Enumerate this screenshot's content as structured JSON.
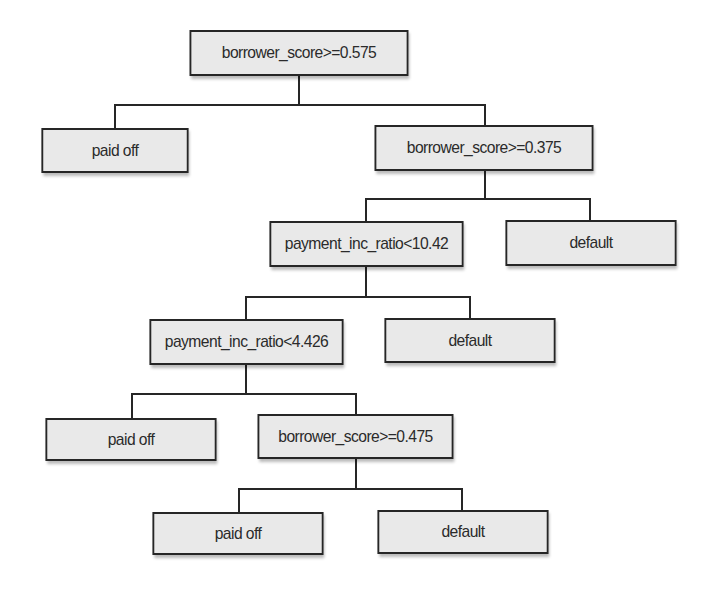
{
  "diagram": {
    "type": "decision-tree",
    "colors": {
      "node_fill": "#e9e9e9",
      "node_border": "#262626",
      "text": "#2b2b2b",
      "edge": "#262626",
      "background": "#ffffff"
    },
    "nodes": [
      {
        "id": "n1",
        "label": "borrower_score>=0.575",
        "kind": "split",
        "x": 180,
        "y": 30,
        "w": 238,
        "h": 46
      },
      {
        "id": "n2",
        "label": "paid off",
        "kind": "leaf",
        "x": 35,
        "y": 128,
        "w": 160,
        "h": 45
      },
      {
        "id": "n3",
        "label": "borrower_score>=0.375",
        "kind": "split",
        "x": 365,
        "y": 125,
        "w": 238,
        "h": 46
      },
      {
        "id": "n4",
        "label": "payment_inc_ratio<10.42",
        "kind": "split",
        "x": 261,
        "y": 221,
        "w": 211,
        "h": 46
      },
      {
        "id": "n5",
        "label": "default",
        "kind": "leaf",
        "x": 498,
        "y": 220,
        "w": 186,
        "h": 46
      },
      {
        "id": "n6",
        "label": "payment_inc_ratio<4.426",
        "kind": "split",
        "x": 141,
        "y": 319,
        "w": 211,
        "h": 46
      },
      {
        "id": "n7",
        "label": "default",
        "kind": "leaf",
        "x": 377,
        "y": 318,
        "w": 186,
        "h": 45
      },
      {
        "id": "n8",
        "label": "paid off",
        "kind": "leaf",
        "x": 38,
        "y": 418,
        "w": 186,
        "h": 43
      },
      {
        "id": "n9",
        "label": "borrower_score>=0.475",
        "kind": "split",
        "x": 249,
        "y": 414,
        "w": 213,
        "h": 45
      },
      {
        "id": "n10",
        "label": "paid off",
        "kind": "leaf",
        "x": 145,
        "y": 512,
        "w": 186,
        "h": 43
      },
      {
        "id": "n11",
        "label": "default",
        "kind": "leaf",
        "x": 370,
        "y": 510,
        "w": 186,
        "h": 44
      }
    ],
    "edges": [
      {
        "from": "n1",
        "to": "n2"
      },
      {
        "from": "n1",
        "to": "n3"
      },
      {
        "from": "n3",
        "to": "n4"
      },
      {
        "from": "n3",
        "to": "n5"
      },
      {
        "from": "n4",
        "to": "n6"
      },
      {
        "from": "n4",
        "to": "n7"
      },
      {
        "from": "n6",
        "to": "n8"
      },
      {
        "from": "n6",
        "to": "n9"
      },
      {
        "from": "n9",
        "to": "n10"
      },
      {
        "from": "n9",
        "to": "n11"
      }
    ],
    "connectors": [
      {
        "parent_x": 299,
        "parent_bottom": 76,
        "bar_y": 104,
        "left_x": 115,
        "right_x": 485,
        "left_top": 128,
        "right_top": 125
      },
      {
        "parent_x": 485,
        "parent_bottom": 171,
        "bar_y": 198,
        "left_x": 366,
        "right_x": 590,
        "left_top": 221,
        "right_top": 220
      },
      {
        "parent_x": 366,
        "parent_bottom": 267,
        "bar_y": 296,
        "left_x": 246,
        "right_x": 470,
        "left_top": 319,
        "right_top": 318
      },
      {
        "parent_x": 246,
        "parent_bottom": 365,
        "bar_y": 393,
        "left_x": 132,
        "right_x": 356,
        "left_top": 418,
        "right_top": 414
      },
      {
        "parent_x": 356,
        "parent_bottom": 459,
        "bar_y": 488,
        "left_x": 239,
        "right_x": 462,
        "left_top": 512,
        "right_top": 510
      }
    ]
  }
}
